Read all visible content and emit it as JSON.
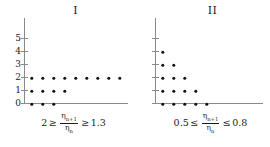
{
  "figure": {
    "background": "#ffffff",
    "dot_color": "#111111",
    "axis_color": "#8a8a8a"
  },
  "panels": [
    {
      "id": "panel-I",
      "title": "I",
      "caption": {
        "left_value": "2",
        "left_relation": "≥",
        "numerator": "η",
        "numerator_sub": "n+1",
        "denominator": "η",
        "denominator_sub": "n",
        "right_relation": "≥",
        "right_value": "1.3",
        "full_text": "2 ≥ ηn+1/ηn ≥ 1.3"
      },
      "y_ticks": [
        "0",
        "1",
        "2",
        "3",
        "4",
        "5"
      ],
      "y_labels_visible": true
    },
    {
      "id": "panel-II",
      "title": "II",
      "caption": {
        "left_value": "0.5",
        "left_relation": "≤",
        "numerator": "η",
        "numerator_sub": "n+1",
        "denominator": "η",
        "denominator_sub": "n",
        "right_relation": "≤",
        "right_value": "0.8",
        "full_text": "0.5 ≤ ηn+1/ηn ≤ 0.8"
      },
      "y_ticks": [
        "0",
        "1",
        "2",
        "3",
        "4",
        "5"
      ],
      "y_labels_visible": false
    }
  ],
  "chart_data": [
    {
      "type": "scatter",
      "title": "I",
      "xlabel": "",
      "ylabel": "",
      "xlim": [
        0,
        10
      ],
      "ylim": [
        0,
        5.5
      ],
      "grid": false,
      "legend": "none",
      "annotation": "2 ≥ ηn+1/ηn ≥ 1.3",
      "points": [
        {
          "x": 1,
          "y": 0
        },
        {
          "x": 2,
          "y": 0
        },
        {
          "x": 3,
          "y": 0
        },
        {
          "x": 1,
          "y": 1
        },
        {
          "x": 2,
          "y": 1
        },
        {
          "x": 3,
          "y": 1
        },
        {
          "x": 4,
          "y": 1
        },
        {
          "x": 1,
          "y": 2
        },
        {
          "x": 2,
          "y": 2
        },
        {
          "x": 3,
          "y": 2
        },
        {
          "x": 4,
          "y": 2
        },
        {
          "x": 5,
          "y": 2
        },
        {
          "x": 6,
          "y": 2
        },
        {
          "x": 7,
          "y": 2
        },
        {
          "x": 8,
          "y": 2
        },
        {
          "x": 9,
          "y": 2
        }
      ],
      "row_counts": {
        "0": 3,
        "1": 4,
        "2": 9,
        "3": 0,
        "4": 0,
        "5": 0
      }
    },
    {
      "type": "scatter",
      "title": "II",
      "xlabel": "",
      "ylabel": "",
      "xlim": [
        0,
        10
      ],
      "ylim": [
        0,
        5.5
      ],
      "grid": false,
      "legend": "none",
      "annotation": "0.5 ≤ ηn+1/ηn ≤ 0.8",
      "points": [
        {
          "x": 1,
          "y": 0
        },
        {
          "x": 2,
          "y": 0
        },
        {
          "x": 3,
          "y": 0
        },
        {
          "x": 4,
          "y": 0
        },
        {
          "x": 5,
          "y": 0
        },
        {
          "x": 1,
          "y": 1
        },
        {
          "x": 2,
          "y": 1
        },
        {
          "x": 3,
          "y": 1
        },
        {
          "x": 4,
          "y": 1
        },
        {
          "x": 1,
          "y": 2
        },
        {
          "x": 2,
          "y": 2
        },
        {
          "x": 3,
          "y": 2
        },
        {
          "x": 1,
          "y": 3
        },
        {
          "x": 2,
          "y": 3
        },
        {
          "x": 1,
          "y": 4
        }
      ],
      "row_counts": {
        "0": 5,
        "1": 4,
        "2": 3,
        "3": 2,
        "4": 1,
        "5": 0
      }
    }
  ]
}
